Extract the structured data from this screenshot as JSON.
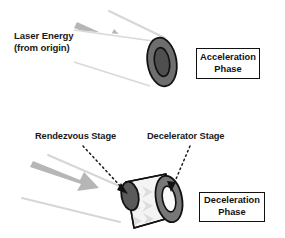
{
  "figure": {
    "background_color": "#ffffff",
    "ink_color": "#111111"
  },
  "colors": {
    "beam_line": "#d6d6d6",
    "beam_arrow": "#b4b4b4",
    "ring_outer": "#6e6e6e",
    "ring_inner": "#4a4a4a",
    "cone_body": "#f2f2f2",
    "cone_chevron": "#dcdcdc",
    "outline": "#111111",
    "text": "#1a1a1a",
    "dotted_leader": "#1a1a1a"
  },
  "panels": {
    "acceleration": {
      "laser_label": {
        "line1": "Laser Energy",
        "line2": "(from origin)"
      },
      "phase_box": {
        "line1": "Acceleration",
        "line2": "Phase"
      },
      "vehicle": {
        "shape": "cylinder",
        "end_cap": "annular-ring"
      },
      "beam": {
        "direction": "down-right",
        "arrow_count": 1,
        "line_count": 2
      }
    },
    "deceleration": {
      "stage_labels": [
        {
          "text": "Rendezvous Stage",
          "points_to": "cone-tip"
        },
        {
          "text": "Decelerator Stage",
          "points_to": "cone-ring"
        }
      ],
      "phase_box": {
        "line1": "Deceleration",
        "line2": "Phase"
      },
      "vehicle": {
        "shape": "cone",
        "narrow_end": "rendezvous-stage-disc",
        "wide_end": "decelerator-stage-ring"
      },
      "beam": {
        "direction": "down-right",
        "arrow_count": 1,
        "line_count": 2
      }
    }
  }
}
